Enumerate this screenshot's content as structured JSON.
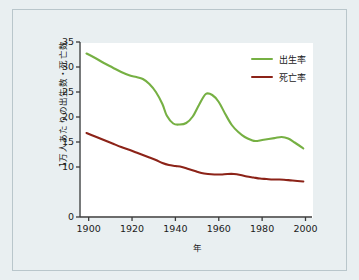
{
  "chart_data": {
    "type": "line",
    "title": "",
    "xlabel": "年",
    "ylabel": "1万人あたりの出生数・死亡数",
    "xlim": [
      1896,
      2003
    ],
    "ylim": [
      0,
      35
    ],
    "grid": false,
    "legend_position": "top-right",
    "xticks": [
      1900,
      1920,
      1940,
      1960,
      1980,
      2000
    ],
    "xtick_labels": [
      "1900",
      "1920",
      "1940",
      "1960",
      "1980",
      "2000"
    ],
    "yticks": [
      0,
      10,
      15,
      20,
      25,
      30,
      35
    ],
    "ytick_labels": [
      "0",
      "10",
      "15",
      "20",
      "25",
      "30",
      "35"
    ],
    "series": [
      {
        "name": "出生率",
        "color": "#76b043",
        "x": [
          1899,
          1903,
          1907,
          1911,
          1915,
          1919,
          1922,
          1925,
          1928,
          1931,
          1934,
          1936,
          1939,
          1942,
          1945,
          1948,
          1951,
          1954,
          1957,
          1960,
          1963,
          1966,
          1969,
          1972,
          1975,
          1977,
          1980,
          1983,
          1986,
          1989,
          1992,
          1995,
          1999
        ],
        "y": [
          32.7,
          31.8,
          30.8,
          29.9,
          29.0,
          28.3,
          28.0,
          27.6,
          26.6,
          25.0,
          22.6,
          20.3,
          18.7,
          18.5,
          18.8,
          20.1,
          22.5,
          24.6,
          24.4,
          23.0,
          20.6,
          18.4,
          17.0,
          16.0,
          15.4,
          15.2,
          15.4,
          15.6,
          15.8,
          16.0,
          15.7,
          14.9,
          13.7
        ]
      },
      {
        "name": "死亡率",
        "color": "#8c2318",
        "x": [
          1899,
          1903,
          1907,
          1911,
          1915,
          1919,
          1922,
          1925,
          1928,
          1931,
          1934,
          1937,
          1940,
          1943,
          1946,
          1949,
          1952,
          1955,
          1958,
          1961,
          1964,
          1967,
          1970,
          1973,
          1976,
          1979,
          1982,
          1985,
          1988,
          1991,
          1994,
          1999
        ],
        "y": [
          16.8,
          16.1,
          15.4,
          14.7,
          14.0,
          13.4,
          12.9,
          12.4,
          11.9,
          11.4,
          10.8,
          10.4,
          10.2,
          10.0,
          9.6,
          9.2,
          8.8,
          8.6,
          8.5,
          8.5,
          8.6,
          8.6,
          8.4,
          8.1,
          7.9,
          7.7,
          7.6,
          7.5,
          7.5,
          7.4,
          7.3,
          7.1
        ]
      }
    ]
  },
  "colors": {
    "page_background": "#e9eff1",
    "plot_background": "#ffffff",
    "frame_border": "#b9c6cb",
    "axis": "#3b3b3b",
    "birth_rate": "#76b043",
    "death_rate": "#8c2318"
  }
}
